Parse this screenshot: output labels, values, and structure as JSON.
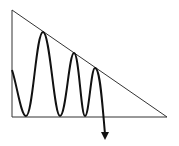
{
  "diagram": {
    "title": "",
    "type": "descending-triangle-pattern",
    "colors": {
      "background": "#ffffff",
      "line": "#1a1a1a"
    },
    "triangle": {
      "top": [
        12,
        10
      ],
      "bottom_left": [
        12,
        117
      ],
      "bottom_right": [
        167,
        117
      ]
    },
    "price_path": {
      "points": [
        [
          12,
          70
        ],
        [
          26,
          116
        ],
        [
          43,
          32
        ],
        [
          60,
          116
        ],
        [
          74,
          53
        ],
        [
          85,
          116
        ],
        [
          95,
          68
        ],
        [
          105,
          136
        ]
      ]
    },
    "arrow": {
      "direction": "down",
      "tip": [
        105,
        139
      ]
    }
  }
}
